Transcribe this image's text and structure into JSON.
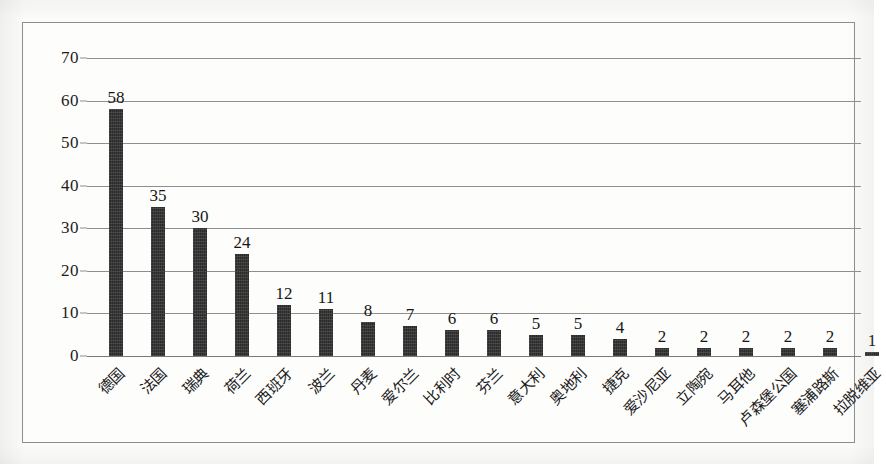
{
  "chart_data": {
    "type": "bar",
    "title": "",
    "subtitle": "",
    "xlabel": "",
    "ylabel": "",
    "ylim": [
      0,
      70
    ],
    "ytick_values": [
      0,
      10,
      20,
      30,
      40,
      50,
      60,
      70
    ],
    "ytick_labels": [
      "0",
      "10",
      "20",
      "30",
      "40",
      "50",
      "60",
      "70"
    ],
    "grid": "horizontal",
    "legend": "none",
    "bar_color": "#2b2b2b",
    "gridline_color": "#8f8f8f",
    "frame_color": "#8e8e8e",
    "background_color": "#fdfdfc",
    "categories": [
      "德国",
      "法国",
      "瑞典",
      "荷兰",
      "西班牙",
      "波兰",
      "丹麦",
      "爱尔兰",
      "比利时",
      "芬兰",
      "意大利",
      "奥地利",
      "捷克",
      "爱沙尼亚",
      "立陶宛",
      "马耳他",
      "卢森堡公国",
      "塞浦路斯",
      "拉脱维亚"
    ],
    "values": [
      58,
      35,
      30,
      24,
      12,
      11,
      8,
      7,
      6,
      6,
      5,
      5,
      4,
      2,
      2,
      2,
      2,
      2,
      1
    ],
    "data_labels": [
      "58",
      "35",
      "30",
      "24",
      "12",
      "11",
      "8",
      "7",
      "6",
      "6",
      "5",
      "5",
      "4",
      "2",
      "2",
      "2",
      "2",
      "2",
      "1"
    ]
  }
}
